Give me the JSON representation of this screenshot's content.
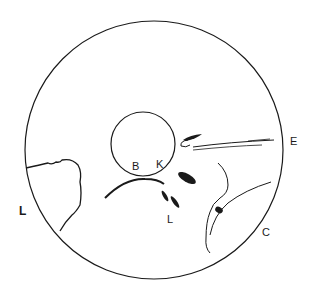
{
  "figure": {
    "labels": {
      "left_L": "L",
      "B": "B",
      "K": "K",
      "lower_L": "L",
      "E": "E",
      "C": "C"
    },
    "colors": {
      "ink": "#1a1a1a",
      "background": "#ffffff"
    }
  }
}
